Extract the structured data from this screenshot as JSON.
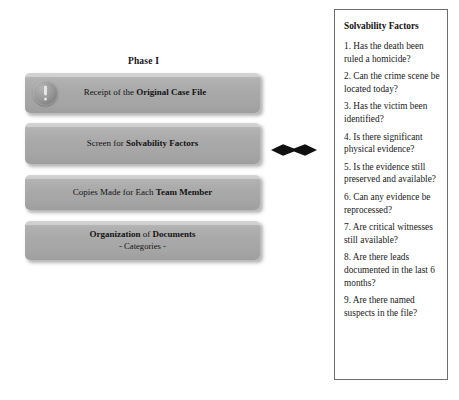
{
  "diagram": {
    "phase_title": "Phase I",
    "boxes": [
      {
        "id": "receipt",
        "icon": "exclamation-circle-icon",
        "text_plain": "Receipt of the Original Case File",
        "text_normal": "Receipt of the ",
        "text_bold": "Original Case File"
      },
      {
        "id": "screen",
        "text_plain": "Screen for Solvability Factors",
        "text_normal": "Screen for ",
        "text_bold": "Solvability Factors"
      },
      {
        "id": "copies",
        "text_plain": "Copies Made for Each Team Member",
        "text_normal": "Copies Made for Each ",
        "text_bold": "Team Member"
      },
      {
        "id": "organization",
        "text_plain": "Organization of Documents - Categories -",
        "text_bold": "Organization",
        "text_normal": " of ",
        "text_bold2": "Documents",
        "subtitle": "- Categories -"
      }
    ],
    "connector": {
      "name": "double-headed-arrow",
      "direction": "bidirectional-horizontal"
    }
  },
  "panel": {
    "title": "Solvability Factors",
    "factors": [
      "1. Has the death been ruled a homicide?",
      "2. Can the crime scene be located today?",
      "3. Has the victim been identified?",
      "4. Is there significant physical evidence?",
      "5. Is the evidence still preserved and available?",
      "6. Can any evidence be reprocessed?",
      "7. Are critical witnesses still available?",
      "8. Are there leads documented in the last 6 months?",
      "9. Are there named suspects in the file?"
    ]
  },
  "colors": {
    "box_fill": "#a9a9a9",
    "box_fill_light": "#c2c2c2",
    "panel_border": "#6e6e6e",
    "text": "#141414",
    "background": "#ffffff"
  }
}
